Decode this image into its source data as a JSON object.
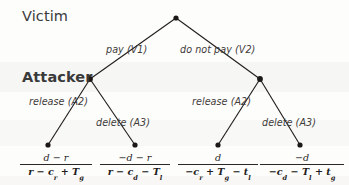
{
  "figure": {
    "type": "game-tree",
    "title_players": {
      "victim": "Victim",
      "attacker": "Attacker"
    }
  },
  "edges": {
    "pay": "pay (V1)",
    "do_not_pay": "do not pay (V2)",
    "release_left": "release (A2)",
    "delete_left": "delete (A3)",
    "release_right": "release (A2)",
    "delete_right": "delete (A3)"
  },
  "payoffs": [
    {
      "id": "pay-release",
      "numerator": "d − r",
      "denominator_parts": [
        {
          "t": "r − c"
        },
        {
          "sub": "r"
        },
        {
          "t": " + T"
        },
        {
          "sub": "g"
        }
      ],
      "denominator": "r − c_r + T_g"
    },
    {
      "id": "pay-delete",
      "numerator": "−d − r",
      "denominator_parts": [
        {
          "t": "r − c"
        },
        {
          "sub": "d"
        },
        {
          "t": " − T"
        },
        {
          "sub": "l"
        }
      ],
      "denominator": "r − c_d − T_l"
    },
    {
      "id": "nopay-release",
      "numerator": "d",
      "denominator_parts": [
        {
          "t": "−c"
        },
        {
          "sub": "r"
        },
        {
          "t": " + T"
        },
        {
          "sub": "g"
        },
        {
          "t": " − t"
        },
        {
          "sub": "l"
        }
      ],
      "denominator": "−c_r + T_g − t_l"
    },
    {
      "id": "nopay-delete",
      "numerator": "−d",
      "denominator_parts": [
        {
          "t": "−c"
        },
        {
          "sub": "d"
        },
        {
          "t": " − T"
        },
        {
          "sub": "l"
        },
        {
          "t": " + t"
        },
        {
          "sub": "g"
        }
      ],
      "denominator": "−c_d − T_l + t_g"
    }
  ],
  "colors": {
    "ink": "#231f1e",
    "label": "#3d3b3a",
    "paper": "#fdfdfc"
  }
}
